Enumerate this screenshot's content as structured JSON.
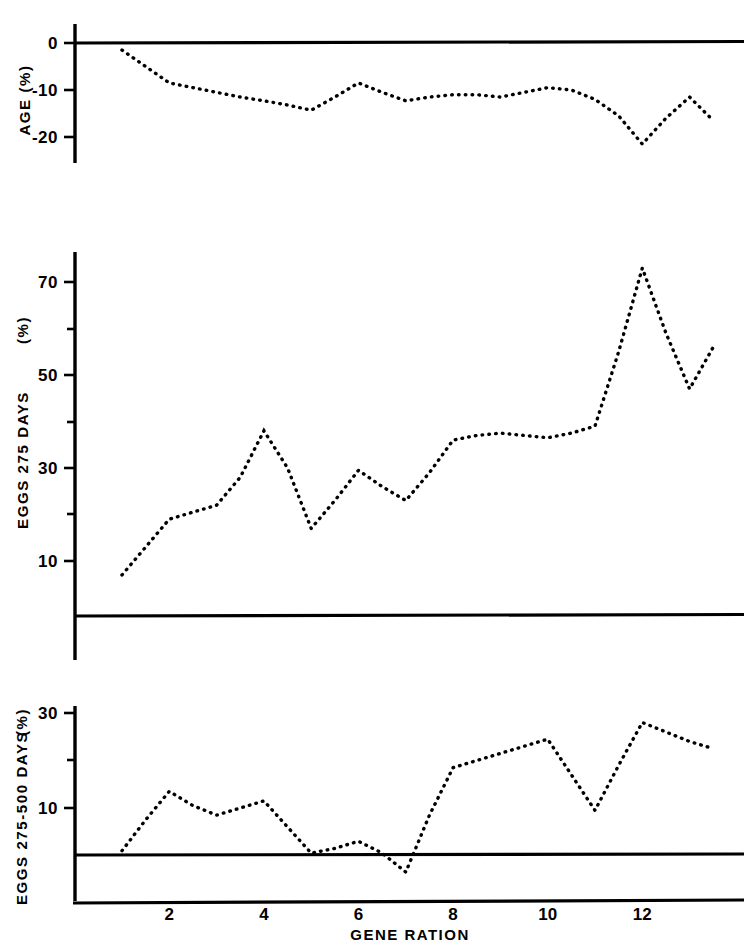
{
  "chart_data": [
    {
      "type": "line",
      "panel": "top",
      "title": "",
      "ylabel": "AGE (%)",
      "xlabel": "",
      "ylim": [
        -25,
        2
      ],
      "xlim": [
        0.6,
        13.6
      ],
      "yticks": [
        0,
        -10,
        -20
      ],
      "ytick_labels": [
        "0",
        "-10",
        "-20"
      ],
      "grid": false,
      "legend": "none",
      "zero_line": 0,
      "series": [
        {
          "name": "AGE (%)",
          "x": [
            1,
            1.5,
            2,
            2.5,
            3,
            3.5,
            4,
            4.5,
            5,
            5.5,
            6,
            6.5,
            7,
            7.5,
            8,
            8.5,
            9,
            9.5,
            10,
            10.5,
            11,
            11.5,
            12,
            12.5,
            13,
            13.5
          ],
          "values": [
            -1.5,
            -5.0,
            -8.5,
            -9.5,
            -10.5,
            -11.5,
            -12.3,
            -13.2,
            -14.3,
            -11.5,
            -8.5,
            -10.5,
            -12.3,
            -11.5,
            -11.0,
            -11.0,
            -11.5,
            -10.5,
            -9.5,
            -10.0,
            -12.0,
            -15.5,
            -21.5,
            -16.0,
            -11.5,
            -16.5
          ]
        }
      ]
    },
    {
      "type": "line",
      "panel": "middle",
      "title": "",
      "ylabel": "EGGS 275  DAYS (%)",
      "xlabel": "",
      "ylim": [
        0,
        78
      ],
      "xlim": [
        0.6,
        13.6
      ],
      "yticks": [
        10,
        30,
        50,
        70
      ],
      "ytick_labels": [
        "10",
        "30",
        "50",
        "70"
      ],
      "yticks_minor": [
        20,
        40,
        60
      ],
      "grid": false,
      "legend": "none",
      "baseline_value": 1,
      "series": [
        {
          "name": "EGGS 275 DAYS (%)",
          "x": [
            1,
            1.5,
            2,
            2.5,
            3,
            3.5,
            4,
            4.5,
            5,
            5.5,
            6,
            6.5,
            7,
            7.5,
            8,
            8.5,
            9,
            9.5,
            10,
            10.5,
            11,
            11.5,
            12,
            12.5,
            13,
            13.5
          ],
          "values": [
            7,
            13,
            19,
            20.5,
            22,
            28,
            38,
            30,
            17,
            23,
            29.5,
            26,
            23,
            29,
            36,
            37,
            37.5,
            37,
            36.5,
            37.5,
            39,
            55,
            73,
            59,
            47,
            56
          ]
        }
      ]
    },
    {
      "type": "line",
      "panel": "bottom",
      "title": "",
      "ylabel": "EGGS  275-500  DAYS (%)",
      "xlabel": "GENE RATION",
      "ylim": [
        -6,
        32
      ],
      "xlim": [
        0.6,
        13.6
      ],
      "yticks": [
        10,
        30
      ],
      "ytick_labels": [
        "10",
        "30"
      ],
      "yticks_minor": [
        20
      ],
      "xticks": [
        2,
        4,
        6,
        8,
        10,
        12
      ],
      "xtick_labels": [
        "2",
        "4",
        "6",
        "8",
        "10",
        "12"
      ],
      "grid": false,
      "legend": "none",
      "zero_line": 0,
      "series": [
        {
          "name": "EGGS 275-500 DAYS (%)",
          "x": [
            1,
            1.5,
            2,
            2.5,
            3,
            3.5,
            4,
            4.5,
            5,
            5.5,
            6,
            6.5,
            7,
            7.5,
            8,
            8.5,
            9,
            9.5,
            10,
            10.5,
            11,
            11.5,
            12,
            12.5,
            13,
            13.5
          ],
          "values": [
            1.0,
            7.5,
            13.5,
            10.5,
            8.5,
            10.0,
            11.5,
            6.0,
            0.5,
            1.5,
            3.0,
            0.5,
            -3.5,
            8.5,
            18.5,
            20.0,
            21.5,
            23.0,
            24.5,
            17.0,
            9.5,
            19.0,
            28.0,
            26.0,
            24.0,
            22.5
          ]
        }
      ]
    }
  ],
  "axis_titles": {
    "top_y": "AGE (%)",
    "middle_y_main": "EGGS 275  DAYS",
    "middle_y_unit": "(%)",
    "bottom_y_main": "EGGS  275-500  DAYS",
    "bottom_y_unit": "(%)",
    "x_title": "GENE RATION"
  },
  "colors": {
    "ink": "#000000",
    "background": "#ffffff"
  }
}
